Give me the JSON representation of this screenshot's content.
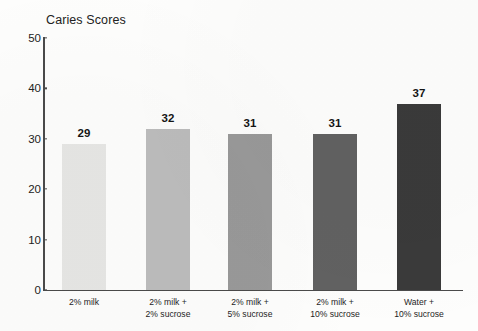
{
  "chart_data": {
    "type": "bar",
    "title": "Caries Scores",
    "xlabel": "",
    "ylabel": "",
    "ylim": [
      0,
      50
    ],
    "grid": false,
    "legend": "none",
    "y_ticks": [
      0,
      10,
      20,
      30,
      40,
      50
    ],
    "y_tick_labels": [
      "0",
      "10",
      "20",
      "30",
      "40",
      "50"
    ],
    "categories": [
      "2% milk",
      "2% milk + 2% sucrose",
      "2% milk + 5% sucrose",
      "2% milk + 10% sucrose",
      "Water + 10% sucrose"
    ],
    "category_lines": [
      [
        "2% milk"
      ],
      [
        "2% milk +",
        "2% sucrose"
      ],
      [
        "2% milk +",
        "5% sucrose"
      ],
      [
        "2% milk +",
        "10% sucrose"
      ],
      [
        "Water +",
        "10% sucrose"
      ]
    ],
    "values": [
      29,
      32,
      31,
      31,
      37
    ],
    "data_labels": [
      "29",
      "32",
      "31",
      "31",
      "37"
    ],
    "bar_colors": [
      "#e6e6e4",
      "#bcbcbc",
      "#999999",
      "#616161",
      "#3a3a3a"
    ],
    "axis_color": "#4a4a4a",
    "background_color": "#fdfdfc",
    "text_color": "#1c1c1c"
  }
}
